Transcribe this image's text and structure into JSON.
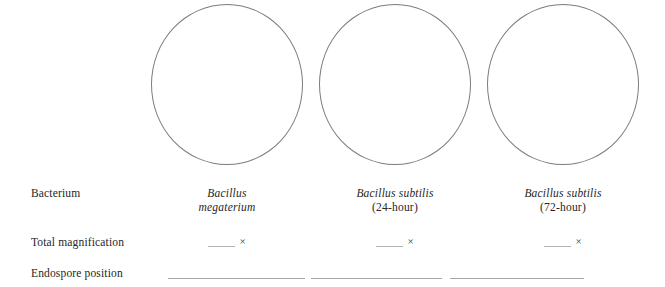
{
  "worksheet": {
    "rows": {
      "bacterium_label": "Bacterium",
      "magnification_label": "Total magnification",
      "endospore_label": "Endospore position"
    },
    "magnification_symbol": "×",
    "colors": {
      "circle_outline": "#7d7d7d",
      "text": "#262626",
      "rule_line": "#a6a6a6",
      "blank_line": "#b4b4b4",
      "background": "#ffffff"
    },
    "columns": [
      {
        "id": "column-1",
        "circle_name": "specimen-drawing-circle-1",
        "species": "Bacillus",
        "species_line2": "megaterium",
        "strain": "",
        "magnification_value": "",
        "magnification_symbol": "×",
        "endospore_position_value": ""
      },
      {
        "id": "column-2",
        "circle_name": "specimen-drawing-circle-2",
        "species": "Bacillus subtilis",
        "species_line2": "",
        "strain": "(24-hour)",
        "magnification_value": "",
        "magnification_symbol": "×",
        "endospore_position_value": ""
      },
      {
        "id": "column-3",
        "circle_name": "specimen-drawing-circle-3",
        "species": "Bacillus subtilis",
        "species_line2": "",
        "strain": "(72-hour)",
        "magnification_value": "",
        "magnification_symbol": "×",
        "endospore_position_value": ""
      }
    ]
  }
}
